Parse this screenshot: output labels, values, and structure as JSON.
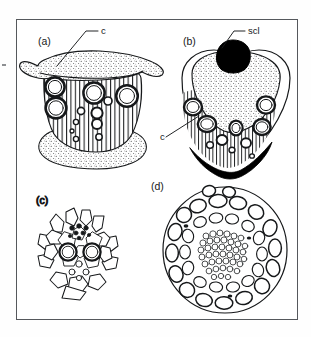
{
  "figure": {
    "kind": "botanical-plate",
    "background_color": "#ffffff",
    "frame_color": "#55585c",
    "ink_color": "#16181a",
    "fill_black": "#000000",
    "fill_white": "#ffffff"
  },
  "panels": [
    {
      "id": "a",
      "label": "(a)",
      "label_x": 38,
      "label_y": 45,
      "caption": "collateral bundle with stippled phloem caps and striated xylem containing large vessels"
    },
    {
      "id": "b",
      "label": "(b)",
      "label_x": 183,
      "label_y": 45,
      "caption": "bundle with black sclerenchyma cap above and black sclerenchyma below"
    },
    {
      "id": "c",
      "label": "(c)",
      "label_x": 36,
      "label_y": 204,
      "caption": "small bundle with two large vessels and a sheath of angular cells"
    },
    {
      "id": "d",
      "label": "(d)",
      "label_x": 151,
      "label_y": 190,
      "caption": "large rounded bundle with dense small-celled core and surrounding oval cells"
    }
  ],
  "annotations": [
    {
      "id": "cambium-a",
      "text": "c",
      "text_x": 101,
      "text_y": 34,
      "leader": [
        [
          98,
          31
        ],
        [
          86,
          31
        ],
        [
          57,
          66
        ]
      ],
      "panel": "a",
      "meaning": "cambium"
    },
    {
      "id": "sclerenchyma-b",
      "text": "scl",
      "text_x": 248,
      "text_y": 34,
      "leader": [
        [
          245,
          31
        ],
        [
          234,
          31
        ],
        [
          222,
          48
        ]
      ],
      "panel": "b",
      "meaning": "sclerenchyma"
    },
    {
      "id": "cambium-b",
      "text": "c",
      "text_x": 160,
      "text_y": 140,
      "leader": [
        [
          166,
          137
        ],
        [
          199,
          116
        ]
      ],
      "panel": "b",
      "meaning": "cambium"
    }
  ]
}
